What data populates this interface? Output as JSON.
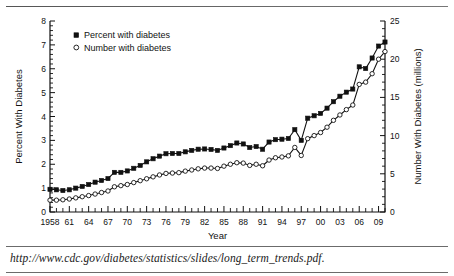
{
  "caption": "http://www.cdc.gov/diabetes/statistics/slides/long_term_trends.pdf.",
  "legend": {
    "percent_label": "Percent with diabetes",
    "number_label": "Number with diabetes"
  },
  "colors": {
    "ink": "#111111",
    "rule": "#6b6b6b",
    "background": "#ffffff"
  },
  "chart_data": {
    "type": "line",
    "title": "",
    "subtitle": "",
    "xlabel": "Year",
    "ylabel": "Percent With Diabetes",
    "y2label": "Number With Diabetes (millions)",
    "xlim": [
      1958,
      2010
    ],
    "ylim": [
      0,
      8
    ],
    "y2lim": [
      0,
      25
    ],
    "yticks": [
      0,
      1,
      2,
      3,
      4,
      5,
      6,
      7,
      8
    ],
    "yticklabels": [
      "0",
      "1",
      "2",
      "3",
      "4",
      "5",
      "6",
      "7",
      "8"
    ],
    "y2ticks": [
      0,
      5,
      10,
      15,
      20,
      25
    ],
    "y2ticklabels": [
      "0",
      "5",
      "10",
      "15",
      "20",
      "25"
    ],
    "xticks": [
      1958,
      1961,
      1964,
      1967,
      1970,
      1973,
      1976,
      1979,
      1982,
      1985,
      1988,
      1991,
      1994,
      1997,
      2000,
      2003,
      2006,
      2009
    ],
    "xticklabels": [
      "1958",
      "61",
      "64",
      "67",
      "70",
      "73",
      "76",
      "79",
      "82",
      "85",
      "88",
      "91",
      "94",
      "97",
      "00",
      "03",
      "06",
      "09"
    ],
    "grid": false,
    "legend_position": "upper left",
    "x": [
      1958,
      1959,
      1960,
      1961,
      1962,
      1963,
      1964,
      1965,
      1966,
      1967,
      1968,
      1969,
      1970,
      1971,
      1972,
      1973,
      1974,
      1975,
      1976,
      1977,
      1978,
      1979,
      1980,
      1981,
      1982,
      1983,
      1984,
      1985,
      1986,
      1987,
      1988,
      1989,
      1990,
      1991,
      1992,
      1993,
      1994,
      1995,
      1996,
      1997,
      1998,
      1999,
      2000,
      2001,
      2002,
      2003,
      2004,
      2005,
      2006,
      2007,
      2008,
      2009,
      2010
    ],
    "series": [
      {
        "name": "Percent with diabetes",
        "axis": "left",
        "unit": "percent",
        "marker": "filled-square",
        "values": [
          0.95,
          0.93,
          0.9,
          0.93,
          1.0,
          1.07,
          1.15,
          1.25,
          1.32,
          1.4,
          1.66,
          1.66,
          1.72,
          1.83,
          1.95,
          2.1,
          2.23,
          2.34,
          2.44,
          2.45,
          2.45,
          2.52,
          2.58,
          2.63,
          2.64,
          2.62,
          2.58,
          2.68,
          2.78,
          2.89,
          2.85,
          2.7,
          2.74,
          2.63,
          2.93,
          3.03,
          3.05,
          3.08,
          3.45,
          3.0,
          3.93,
          4.03,
          4.13,
          4.35,
          4.62,
          4.85,
          5.02,
          5.15,
          6.08,
          6.01,
          6.45,
          6.95,
          7.12
        ]
      },
      {
        "name": "Number with diabetes",
        "axis": "right",
        "unit": "millions",
        "marker": "open-circle",
        "values": [
          1.55,
          1.55,
          1.6,
          1.7,
          1.85,
          2.0,
          2.15,
          2.35,
          2.55,
          2.75,
          3.3,
          3.45,
          3.6,
          3.85,
          4.1,
          4.35,
          4.6,
          4.85,
          5.05,
          5.1,
          5.15,
          5.35,
          5.5,
          5.65,
          5.75,
          5.75,
          5.7,
          6.0,
          6.25,
          6.45,
          6.4,
          6.1,
          6.25,
          6.05,
          6.8,
          7.1,
          7.2,
          7.35,
          8.45,
          7.4,
          9.6,
          10.0,
          10.4,
          11.1,
          12.0,
          12.7,
          13.4,
          14.0,
          16.7,
          17.0,
          18.1,
          20.0,
          21.0
        ]
      }
    ]
  }
}
